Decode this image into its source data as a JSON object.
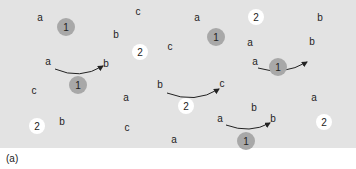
{
  "figure": {
    "caption": "(a)",
    "colors": {
      "background": "#e3e3e3",
      "particle_1": "#a8a8a8",
      "particle_2": "#ffffff",
      "arrow": "#222222"
    }
  },
  "letters": [
    {
      "text": "a",
      "x": 40,
      "y": 18
    },
    {
      "text": "c",
      "x": 138,
      "y": 12
    },
    {
      "text": "a",
      "x": 197,
      "y": 18
    },
    {
      "text": "b",
      "x": 320,
      "y": 18
    },
    {
      "text": "b",
      "x": 116,
      "y": 35
    },
    {
      "text": "c",
      "x": 170,
      "y": 47
    },
    {
      "text": "a",
      "x": 250,
      "y": 43
    },
    {
      "text": "b",
      "x": 312,
      "y": 42
    },
    {
      "text": "a",
      "x": 48,
      "y": 62
    },
    {
      "text": "b",
      "x": 106,
      "y": 64
    },
    {
      "text": "a",
      "x": 255,
      "y": 62
    },
    {
      "text": "c",
      "x": 34,
      "y": 91
    },
    {
      "text": "a",
      "x": 126,
      "y": 98
    },
    {
      "text": "b",
      "x": 160,
      "y": 85
    },
    {
      "text": "c",
      "x": 222,
      "y": 84
    },
    {
      "text": "b",
      "x": 254,
      "y": 108
    },
    {
      "text": "a",
      "x": 314,
      "y": 98
    },
    {
      "text": "b",
      "x": 62,
      "y": 122
    },
    {
      "text": "c",
      "x": 127,
      "y": 128
    },
    {
      "text": "a",
      "x": 174,
      "y": 140
    },
    {
      "text": "a",
      "x": 220,
      "y": 119
    },
    {
      "text": "b",
      "x": 273,
      "y": 119
    }
  ],
  "particles": [
    {
      "label": "1",
      "type": "one",
      "x": 66,
      "y": 27
    },
    {
      "label": "2",
      "type": "two",
      "x": 256,
      "y": 17
    },
    {
      "label": "2",
      "type": "two",
      "x": 140,
      "y": 52
    },
    {
      "label": "1",
      "type": "one",
      "x": 216,
      "y": 37
    },
    {
      "label": "1",
      "type": "one",
      "x": 78,
      "y": 85
    },
    {
      "label": "1",
      "type": "one",
      "x": 278,
      "y": 67
    },
    {
      "label": "2",
      "type": "two",
      "x": 186,
      "y": 106
    },
    {
      "label": "2",
      "type": "two",
      "x": 37,
      "y": 126
    },
    {
      "label": "2",
      "type": "two",
      "x": 324,
      "y": 122
    },
    {
      "label": "1",
      "type": "one",
      "x": 246,
      "y": 141
    }
  ],
  "arrows": [
    {
      "from": "a",
      "to": "b",
      "d": "M 55 69 Q 80 80 103 66"
    },
    {
      "from": "b",
      "to": "c",
      "d": "M 167 93 Q 195 104 219 89"
    },
    {
      "from": "a",
      "to": "b",
      "d": "M 258 68 Q 283 76 307 62"
    },
    {
      "from": "a",
      "to": "b",
      "d": "M 226 125 Q 250 134 270 123"
    }
  ]
}
